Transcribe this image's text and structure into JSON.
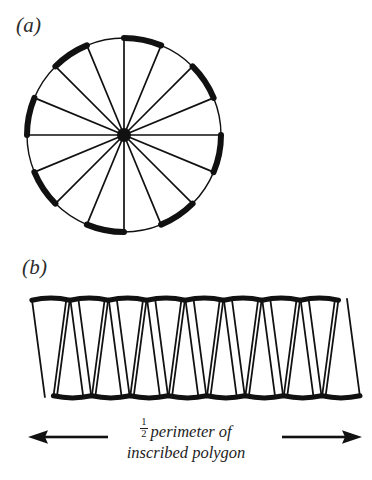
{
  "figure": {
    "panels": [
      {
        "id": "a",
        "label": "(a)",
        "kind": "circle-divided-into-sectors",
        "sector_count": 16,
        "geometry": {
          "center_x": 124,
          "center_y": 135,
          "radius": 97,
          "start_angle_deg": -90
        },
        "style": {
          "stroke_color": "#111111",
          "thick_arc_width": 6.0,
          "thin_arc_width": 1.4,
          "spoke_width": 1.7,
          "hub_radius": 7,
          "fill": "#ffffff"
        },
        "arc_weights": [
          "thick",
          "thin",
          "thick",
          "thin",
          "thick",
          "thin",
          "thick",
          "thin",
          "thick",
          "thin",
          "thick",
          "thin",
          "thick",
          "thin",
          "thick",
          "thin"
        ]
      },
      {
        "id": "b",
        "label": "(b)",
        "kind": "sectors-rearranged-into-strip",
        "sector_count": 16,
        "up_count": 8,
        "down_count": 8,
        "geometry": {
          "left_x": 34,
          "right_x": 341,
          "top_y": 299,
          "bottom_y": 397,
          "wedge_base": 38,
          "wedge_tip": 12
        },
        "style": {
          "stroke_color": "#111111",
          "thick_edge_width": 5.0,
          "thin_edge_width": 1.8,
          "fill": "#ffffff"
        }
      }
    ],
    "caption": {
      "fraction_numerator": "1",
      "fraction_denominator": "2",
      "line1": "perimeter of",
      "line2": "inscribed polygon",
      "full_text": "1/2 perimeter of inscribed polygon"
    },
    "arrows": {
      "left": {
        "name": "arrow-left",
        "direction": "left",
        "glyph": "←"
      },
      "right": {
        "name": "arrow-right",
        "direction": "right",
        "glyph": "→"
      },
      "color": "#111111"
    },
    "colors": {
      "background": "#ffffff",
      "ink": "#111111",
      "text": "#1d1d1d"
    }
  }
}
